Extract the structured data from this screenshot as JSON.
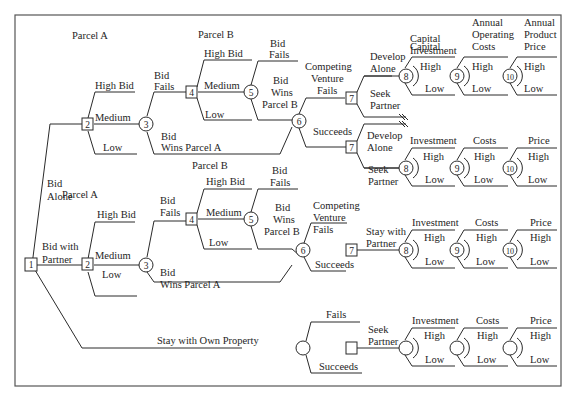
{
  "diagram": {
    "type": "decision-tree",
    "frame_color": "#555555",
    "line_color": "#2a2a2a",
    "root": {
      "id": "1",
      "shape": "square"
    },
    "top_labels": {
      "parcel_a_top": "Parcel A",
      "parcel_b_top": "Parcel B",
      "parcel_a_mid": "Parcel A",
      "parcel_b_mid": "Parcel B",
      "capital_investment": [
        "Capital",
        "Investment"
      ],
      "annual_operating_costs": [
        "Annual",
        "Operating",
        "Costs"
      ],
      "annual_product_price": [
        "Annual",
        "Product",
        "Price"
      ]
    },
    "branch_labels": {
      "bid_alone": [
        "Bid",
        "Alone"
      ],
      "bid_with_partner": [
        "Bid with",
        "Partner"
      ],
      "stay_own": "Stay with Own Property",
      "high_bid": "High Bid",
      "medium": "Medium",
      "low": "Low",
      "bid_fails": [
        "Bid",
        "Fails"
      ],
      "bid_wins_a": [
        "Bid",
        "Wins Parcel A"
      ],
      "bid_wins_b": [
        "Bid",
        "Wins",
        "Parcel B"
      ],
      "competing_fails": [
        "Competing",
        "Venture",
        "Fails"
      ],
      "succeeds": "Succeeds",
      "fails": "Fails",
      "develop_alone": [
        "Develop",
        "Alone"
      ],
      "seek_partner": [
        "Seek",
        "Partner"
      ],
      "stay_with_partner": [
        "Stay with",
        "Partner"
      ],
      "investment": "Investment",
      "costs": "Costs",
      "price": "Price",
      "high": "High"
    },
    "node_numbers": {
      "n1": "1",
      "n2": "2",
      "n3": "3",
      "n4": "4",
      "n5": "5",
      "n6": "6",
      "n7": "7",
      "n8": "8",
      "n9": "9",
      "n10": "10"
    }
  }
}
